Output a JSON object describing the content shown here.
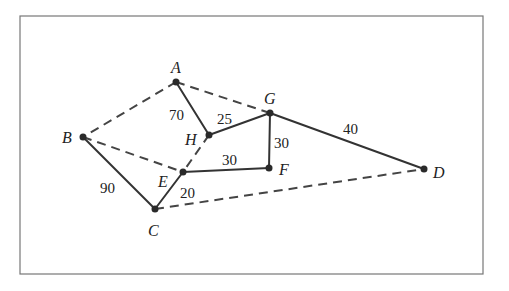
{
  "diagram": {
    "type": "weighted-graph",
    "frame": {
      "x": 20,
      "y": 16,
      "width": 463,
      "height": 258
    },
    "nodes": [
      {
        "id": "A",
        "label": "A",
        "x": 176,
        "y": 82,
        "lx": 171,
        "ly": 73
      },
      {
        "id": "B",
        "label": "B",
        "x": 83,
        "y": 137,
        "lx": 62,
        "ly": 143
      },
      {
        "id": "C",
        "label": "C",
        "x": 155,
        "y": 209,
        "lx": 148,
        "ly": 236
      },
      {
        "id": "D",
        "label": "D",
        "x": 424,
        "y": 169,
        "lx": 433,
        "ly": 178
      },
      {
        "id": "E",
        "label": "E",
        "x": 183,
        "y": 172,
        "lx": 158,
        "ly": 187
      },
      {
        "id": "F",
        "label": "F",
        "x": 269,
        "y": 168,
        "lx": 279,
        "ly": 175
      },
      {
        "id": "G",
        "label": "G",
        "x": 270,
        "y": 113,
        "lx": 264,
        "ly": 104
      },
      {
        "id": "H",
        "label": "H",
        "x": 209,
        "y": 135,
        "lx": 185,
        "ly": 145
      }
    ],
    "edges": [
      {
        "from": "A",
        "to": "H",
        "weight": "70",
        "style": "solid",
        "wx": 169,
        "wy": 120
      },
      {
        "from": "H",
        "to": "G",
        "weight": "25",
        "style": "solid",
        "wx": 217,
        "wy": 124
      },
      {
        "from": "G",
        "to": "F",
        "weight": "30",
        "style": "solid",
        "wx": 274,
        "wy": 148
      },
      {
        "from": "G",
        "to": "D",
        "weight": "40",
        "style": "solid",
        "wx": 343,
        "wy": 134
      },
      {
        "from": "E",
        "to": "F",
        "weight": "30",
        "style": "solid",
        "wx": 222,
        "wy": 165
      },
      {
        "from": "B",
        "to": "C",
        "weight": "90",
        "style": "solid",
        "wx": 100,
        "wy": 193
      },
      {
        "from": "C",
        "to": "E",
        "weight": "20",
        "style": "solid",
        "wx": 180,
        "wy": 198
      },
      {
        "from": "A",
        "to": "B",
        "weight": "",
        "style": "dashed",
        "wx": 0,
        "wy": 0
      },
      {
        "from": "A",
        "to": "G",
        "weight": "",
        "style": "dashed",
        "wx": 0,
        "wy": 0
      },
      {
        "from": "B",
        "to": "E",
        "weight": "",
        "style": "dashed",
        "wx": 0,
        "wy": 0
      },
      {
        "from": "H",
        "to": "E",
        "weight": "",
        "style": "dashed",
        "wx": 0,
        "wy": 0
      },
      {
        "from": "C",
        "to": "D",
        "weight": "",
        "style": "dashed",
        "wx": 0,
        "wy": 0
      }
    ]
  }
}
